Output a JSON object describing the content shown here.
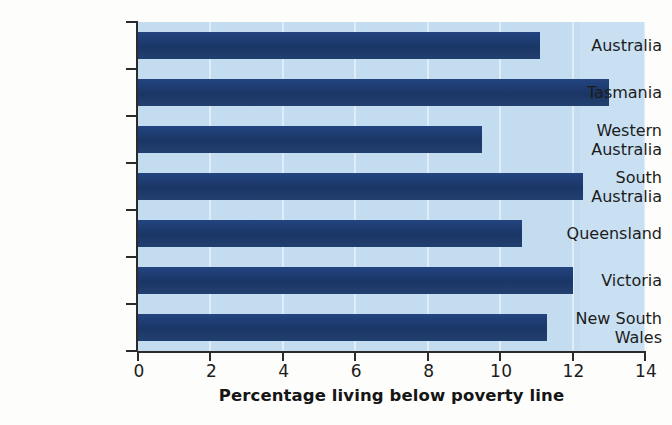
{
  "chart_data": {
    "type": "bar",
    "orientation": "horizontal",
    "title": "",
    "xlabel": "Percentage  living below poverty line",
    "ylabel": "",
    "xlim": [
      0,
      14
    ],
    "ylim": null,
    "grid": "vertical",
    "legend": "none",
    "xticks": [
      "0",
      "2",
      "4",
      "6",
      "8",
      "10",
      "12",
      "14"
    ],
    "xtick_values": [
      0,
      2,
      4,
      6,
      8,
      10,
      12,
      14
    ],
    "categories": [
      "Australia",
      "Tasmania",
      "Western Australia",
      "South Australia",
      "Queensland",
      "Victoria",
      "New South Wales"
    ],
    "category_lines": [
      [
        "Australia"
      ],
      [
        "Tasmania"
      ],
      [
        "Western",
        "Australia"
      ],
      [
        "South",
        "Australia"
      ],
      [
        "Queensland"
      ],
      [
        "Victoria"
      ],
      [
        "New South",
        "Wales"
      ]
    ],
    "values": [
      11.1,
      13.0,
      9.5,
      12.3,
      10.6,
      12.0,
      11.3
    ],
    "series": [
      {
        "name": "Percentage living below poverty line",
        "values": [
          11.1,
          13.0,
          9.5,
          12.3,
          10.6,
          12.0,
          11.3
        ]
      }
    ]
  },
  "colors": {
    "bar": "#1c3a6e",
    "plot_background": "#c3dcf0",
    "plot_background_right": "#c9e0f3",
    "gridline": "#e4f0fa",
    "axis": "#2b2b2b",
    "text": "#1c1c1c",
    "page_background": "#fdfdfb"
  }
}
